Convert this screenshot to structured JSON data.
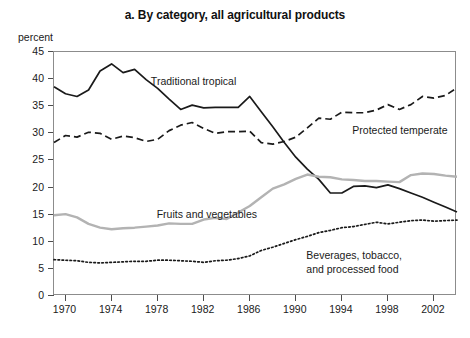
{
  "chart_data": {
    "type": "line",
    "title": "a. By category, all agricultural products",
    "xlabel": "",
    "ylabel": "percent",
    "ylim": [
      0,
      45
    ],
    "xlim": [
      1969,
      2004
    ],
    "grid": false,
    "legend_position": "inline-annotations",
    "y_ticks": [
      0,
      5,
      10,
      15,
      20,
      25,
      30,
      35,
      40,
      45
    ],
    "x_ticks": [
      1970,
      1974,
      1978,
      1982,
      1986,
      1990,
      1994,
      1998,
      2002
    ],
    "x": [
      1969,
      1970,
      1971,
      1972,
      1973,
      1974,
      1975,
      1976,
      1977,
      1978,
      1979,
      1980,
      1981,
      1982,
      1983,
      1984,
      1985,
      1986,
      1987,
      1988,
      1989,
      1990,
      1991,
      1992,
      1993,
      1994,
      1995,
      1996,
      1997,
      1998,
      1999,
      2000,
      2001,
      2002,
      2003,
      2004
    ],
    "series": [
      {
        "name": "Traditional tropical",
        "style": "solid",
        "color": "#1a1a1a",
        "label_x": 1977.5,
        "label_y": 40.5,
        "values": [
          38.6,
          37.3,
          36.8,
          38.0,
          41.5,
          42.8,
          41.2,
          41.8,
          39.9,
          38.3,
          36.3,
          34.4,
          35.2,
          34.7,
          34.8,
          34.8,
          34.8,
          36.8,
          34.0,
          31.2,
          28.3,
          25.6,
          23.4,
          21.5,
          19.0,
          19.0,
          20.2,
          20.3,
          20.0,
          20.5,
          19.8,
          19.0,
          18.2,
          17.3,
          16.4,
          15.5
        ]
      },
      {
        "name": "Protected temperate",
        "style": "dashed",
        "color": "#1a1a1a",
        "label_x": 1995.0,
        "label_y": 31.5,
        "values": [
          28.3,
          29.6,
          29.3,
          30.2,
          30.0,
          28.9,
          29.5,
          29.2,
          28.5,
          28.9,
          30.5,
          31.5,
          32.0,
          30.9,
          30.0,
          30.3,
          30.3,
          30.4,
          28.3,
          28.0,
          28.5,
          29.3,
          31.0,
          32.8,
          32.6,
          33.9,
          33.8,
          33.8,
          34.3,
          35.3,
          34.4,
          35.3,
          36.8,
          36.5,
          37.0,
          38.4
        ]
      },
      {
        "name": "Fruits and vegetables",
        "style": "solid",
        "color": "#b3b3b3",
        "label_x": 1978.0,
        "label_y": 16.0,
        "values": [
          14.9,
          15.1,
          14.5,
          13.3,
          12.6,
          12.3,
          12.5,
          12.6,
          12.8,
          13.0,
          13.4,
          13.3,
          13.3,
          14.1,
          14.4,
          14.2,
          15.4,
          16.6,
          18.2,
          19.8,
          20.6,
          21.6,
          22.4,
          22.0,
          21.9,
          21.5,
          21.4,
          21.2,
          21.2,
          21.1,
          21.0,
          22.3,
          22.6,
          22.5,
          22.2,
          22.0
        ]
      },
      {
        "name": "Beverages, tobacco,\nand processed food",
        "style": "dotted",
        "color": "#1a1a1a",
        "label_x": 1991.0,
        "label_y": 8.4,
        "values": [
          6.7,
          6.6,
          6.5,
          6.2,
          6.1,
          6.2,
          6.3,
          6.4,
          6.4,
          6.6,
          6.6,
          6.5,
          6.4,
          6.2,
          6.5,
          6.6,
          6.9,
          7.4,
          8.4,
          9.0,
          9.7,
          10.4,
          11.0,
          11.7,
          12.1,
          12.6,
          12.8,
          13.2,
          13.6,
          13.3,
          13.6,
          13.9,
          14.0,
          13.8,
          13.9,
          14.0
        ]
      }
    ]
  }
}
